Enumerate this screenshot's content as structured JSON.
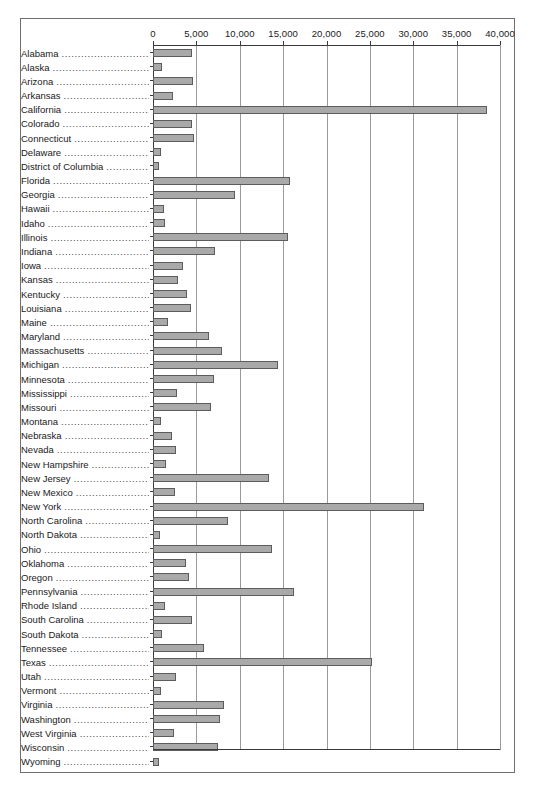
{
  "chart_data": {
    "type": "bar",
    "orientation": "horizontal",
    "title": "",
    "xlabel": "",
    "ylabel": "",
    "xlim": [
      0,
      40000
    ],
    "xticks": [
      0,
      5000,
      10000,
      15000,
      20000,
      25000,
      30000,
      35000,
      40000
    ],
    "xtick_labels": [
      "0",
      "5,000",
      "10,000",
      "15,000",
      "20,000",
      "25,000",
      "30,000",
      "35,000",
      "40,000"
    ],
    "grid": true,
    "legend": false,
    "axis_position": "top",
    "bar_fill_color": "#a9a9a9",
    "bar_border_color": "#5c5c5c",
    "gridline_color": "#9a9a9a",
    "axis_color": "#3a3a3a",
    "frame_border_color": "#6f6f6f",
    "categories": [
      "Alabama",
      "Alaska",
      "Arizona",
      "Arkansas",
      "California",
      "Colorado",
      "Connecticut",
      "Delaware",
      "District of Columbia",
      "Florida",
      "Georgia",
      "Hawaii",
      "Idaho",
      "Illinois",
      "Indiana",
      "Iowa",
      "Kansas",
      "Kentucky",
      "Louisiana",
      "Maine",
      "Maryland",
      "Massachusetts",
      "Michigan",
      "Minnesota",
      "Mississippi",
      "Missouri",
      "Montana",
      "Nebraska",
      "Nevada",
      "New Hampshire",
      "New Jersey",
      "New Mexico",
      "New York",
      "North Carolina",
      "North Dakota",
      "Ohio",
      "Oklahoma",
      "Oregon",
      "Pennsylvania",
      "Rhode Island",
      "South Carolina",
      "South Dakota",
      "Tennessee",
      "Texas",
      "Utah",
      "Vermont",
      "Virginia",
      "Washington",
      "West Virginia",
      "Wisconsin",
      "Wyoming"
    ],
    "values": [
      4500,
      1000,
      4600,
      2300,
      38500,
      4500,
      4700,
      900,
      700,
      15800,
      9500,
      1300,
      1400,
      15600,
      7200,
      3500,
      2900,
      3900,
      4400,
      1700,
      6400,
      8000,
      14400,
      7000,
      2800,
      6700,
      900,
      2200,
      2700,
      1500,
      13400,
      2500,
      31200,
      8600,
      800,
      13700,
      3800,
      4100,
      16300,
      1400,
      4500,
      1000,
      5900,
      25200,
      2700,
      900,
      8200,
      7700,
      2400,
      7500,
      700
    ]
  }
}
